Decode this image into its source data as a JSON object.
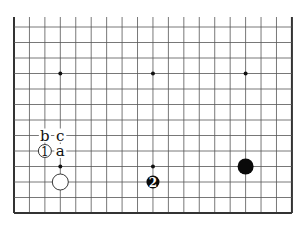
{
  "board": {
    "columns": 19,
    "rows_visible": 13,
    "origin_x": 14,
    "origin_y": 27,
    "spacing_x": 15.44,
    "spacing_y": 15.5,
    "top_open_extension": 10,
    "edges": {
      "left": true,
      "right": true,
      "bottom": true,
      "top": false
    },
    "colors": {
      "line": "#555555",
      "edge": "#333333",
      "black": "#0a0a0a",
      "white": "#ffffff"
    }
  },
  "star_points": [
    {
      "col": 3,
      "row": 3
    },
    {
      "col": 9,
      "row": 3
    },
    {
      "col": 15,
      "row": 3
    },
    {
      "col": 3,
      "row": 9
    },
    {
      "col": 9,
      "row": 9
    },
    {
      "col": 15,
      "row": 9
    }
  ],
  "stones": [
    {
      "id": "white-stone-1",
      "color": "white",
      "col": 2,
      "row": 8,
      "label": "1",
      "size": "small"
    },
    {
      "id": "white-stone",
      "color": "white",
      "col": 3,
      "row": 10,
      "label": "",
      "size": "normal"
    },
    {
      "id": "black-stone-2",
      "color": "black",
      "col": 9,
      "row": 10,
      "label": "2",
      "size": "small"
    },
    {
      "id": "black-stone",
      "color": "black",
      "col": 15,
      "row": 9,
      "label": "",
      "size": "normal"
    }
  ],
  "markers": [
    {
      "id": "marker-b",
      "text": "b",
      "col": 2,
      "row": 7
    },
    {
      "id": "marker-c",
      "text": "c",
      "col": 3,
      "row": 7
    },
    {
      "id": "marker-a",
      "text": "a",
      "col": 3,
      "row": 8
    }
  ]
}
